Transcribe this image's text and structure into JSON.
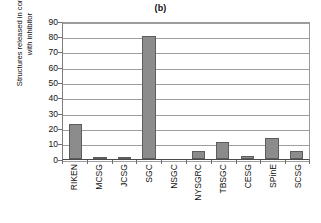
{
  "chart_data": {
    "type": "bar",
    "title": "(b)",
    "xlabel": "",
    "ylabel": "Structures released in complex\nwith inhibitor",
    "categories": [
      "RIKEN",
      "MCSG",
      "JCSG",
      "SGC",
      "NSGC",
      "NYSGRC",
      "TBSGC",
      "CESG",
      "SPinE",
      "SCSG"
    ],
    "values": [
      23,
      1,
      1,
      80,
      0,
      5,
      11,
      2,
      14,
      5
    ],
    "ylim": [
      0,
      90
    ],
    "yticks": [
      0,
      10,
      20,
      30,
      40,
      50,
      60,
      70,
      80,
      90
    ],
    "ytick_labels": [
      "0",
      "10",
      "20",
      "30",
      "40",
      "50",
      "60",
      "70",
      "80",
      "90"
    ],
    "grid": true,
    "grid_axis": "y",
    "legend": false,
    "legend_position": "none",
    "bar_color": "#8c8c8c",
    "bar_edge_color": "#5d5d5d",
    "axis_color": "#4a4a4a",
    "gridline_color": "#9e9e9e",
    "background_color": "#ffffff"
  }
}
